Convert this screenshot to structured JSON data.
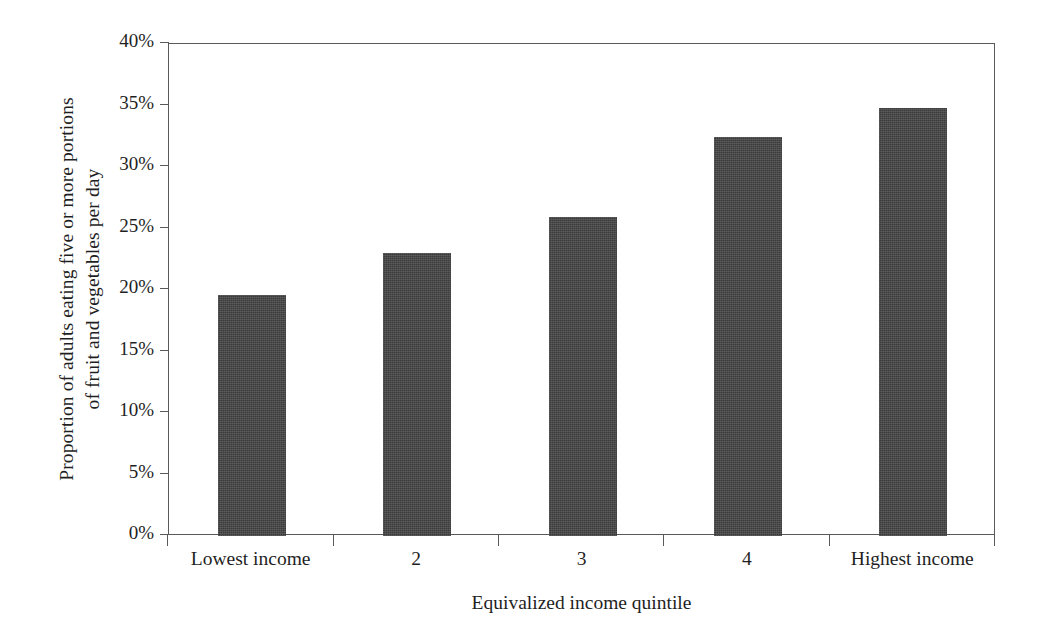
{
  "chart_data": {
    "type": "bar",
    "title": "",
    "subtitle": "",
    "xlabel": "Equivalized income quintile",
    "ylabel": "Proportion of adults eating five or more portions of fruit and vegetables per day",
    "ylabel_lines": [
      "Proportion of adults eating five or more portions",
      "of fruit and vegetables per day"
    ],
    "categories": [
      "Lowest income",
      "2",
      "3",
      "4",
      "Highest income"
    ],
    "values": [
      19.6,
      23.0,
      25.9,
      32.4,
      34.8
    ],
    "value_unit": "%",
    "ylim": [
      0,
      40
    ],
    "ytick_values": [
      0,
      5,
      10,
      15,
      20,
      25,
      30,
      35,
      40
    ],
    "ytick_labels": [
      "0%",
      "5%",
      "10%",
      "15%",
      "20%",
      "25%",
      "30%",
      "35%",
      "40%"
    ],
    "grid": false,
    "legend": null,
    "bar_color": "#3b3b3b",
    "axis_color": "#5a5a5a",
    "background_color": "#ffffff",
    "text_color": "#1f1f1f",
    "annotations": []
  }
}
